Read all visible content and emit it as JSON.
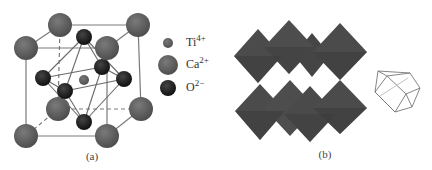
{
  "panel_a": {
    "caption": "(a)",
    "title": "Perovskite unit cell (CaTiO3)",
    "legend": [
      {
        "symbol": "Ti",
        "charge": "4+",
        "color": "#5a5a5a",
        "size": "small"
      },
      {
        "symbol": "Ca",
        "charge": "2+",
        "color": "#5c5c5c",
        "size": "large"
      },
      {
        "symbol": "O",
        "charge": "2−",
        "color": "#1e1e1e",
        "size": "medium"
      }
    ],
    "colors": {
      "ca": "#5c5c5c",
      "ti": "#5a5a5a",
      "o": "#1e1e1e",
      "edge": "#7a7a7a"
    }
  },
  "panel_b": {
    "caption": "(b)",
    "title": "Corner-sharing TiO6 octahedra network with cuboctahedral cavity",
    "colors": {
      "octahedron": "#4a4a4a",
      "octahedron_shade": "#3a3a3a",
      "wire": "#777777"
    }
  }
}
